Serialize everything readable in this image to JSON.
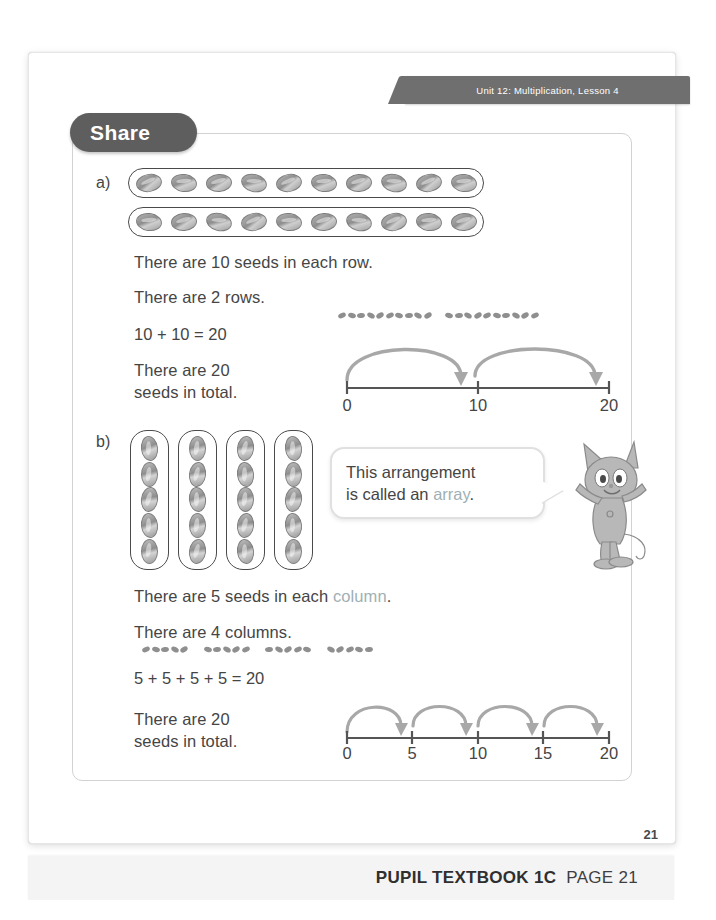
{
  "banner": {
    "unit_text": "Unit 12: Multiplication, Lesson 4"
  },
  "section_tab": {
    "label": "Share"
  },
  "parts": {
    "a": {
      "label": "a)",
      "rows_of_seeds": 2,
      "seeds_per_row": 10,
      "lines": [
        "There are 10 seeds in each row.",
        "There are 2 rows."
      ],
      "equation": "10 + 10 = 20",
      "total_line1": "There are 20",
      "total_line2": "seeds in total.",
      "numberline": {
        "ticks": [
          "0",
          "10",
          "20"
        ],
        "tick_values": [
          0,
          10,
          20
        ],
        "jumps": [
          10,
          10
        ],
        "min": 0,
        "max": 20
      },
      "mini_seed_groups": 2,
      "mini_seeds_per_group": 10
    },
    "b": {
      "label": "b)",
      "columns_of_seeds": 4,
      "seeds_per_column": 5,
      "line1_pre": "There are 5 seeds in each ",
      "line1_highlight": "column",
      "line1_post": ".",
      "line2": "There are 4 columns.",
      "equation": "5 + 5 + 5 + 5 = 20",
      "total_line1": "There are 20",
      "total_line2": "seeds in total.",
      "numberline": {
        "ticks": [
          "0",
          "5",
          "10",
          "15",
          "20"
        ],
        "tick_values": [
          0,
          5,
          10,
          15,
          20
        ],
        "jumps": [
          5,
          5,
          5,
          5
        ],
        "min": 0,
        "max": 20
      },
      "mini_seed_groups": 4,
      "mini_seeds_per_group": 5
    }
  },
  "speech_bubble": {
    "line1": "This arrangement",
    "line2_pre": "is called an ",
    "line2_highlight": "array",
    "line2_post": "."
  },
  "character": {
    "name": "cat-mascot"
  },
  "page_number": "21",
  "footer": {
    "book": "PUPIL TEXTBOOK 1C",
    "page": "PAGE 21"
  },
  "colors": {
    "banner_bg": "#6f6f6f",
    "tab_bg": "#5e5e5e",
    "highlight_text": "#9fb0b4",
    "arc": "#a8a8a8",
    "line": "#555555"
  }
}
